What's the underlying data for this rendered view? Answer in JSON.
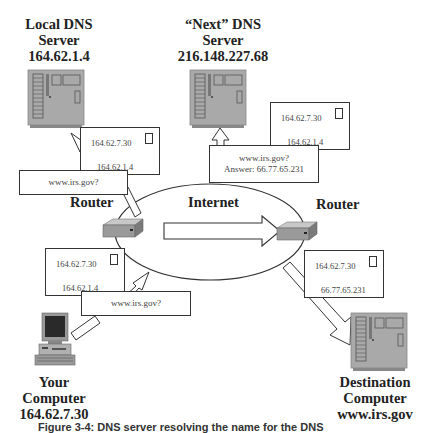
{
  "nodes": {
    "local_dns": {
      "title_lines": [
        "Local DNS",
        "Server",
        "164.62.1.4"
      ],
      "icon": "server-icon"
    },
    "next_dns": {
      "title_lines": [
        "“Next” DNS",
        "Server",
        "216.148.227.68"
      ],
      "icon": "server-icon"
    },
    "your_computer": {
      "title_lines": [
        "Your",
        "Computer",
        "164.62.7.30"
      ],
      "icon": "desktop-computer-icon"
    },
    "destination": {
      "title_lines": [
        "Destination",
        "Computer",
        "www.irs.gov"
      ],
      "icon": "server-icon"
    }
  },
  "routers": {
    "left": {
      "label": "Router",
      "icon": "router-icon"
    },
    "right": {
      "label": "Router",
      "icon": "router-icon"
    }
  },
  "cloud": {
    "label": "Internet"
  },
  "envelopes": {
    "local_dns": {
      "to": "164.62.7.30",
      "from": "164.62.1.4"
    },
    "next_dns": {
      "to": "164.62.7.30",
      "from": "164.62.1.4"
    },
    "your_computer": {
      "to": "164.62.7.30",
      "from": "164.62.1.4"
    },
    "destination": {
      "to": "164.62.7.30",
      "from": "66.77.65.231"
    }
  },
  "queries": {
    "local_dns": {
      "lines": [
        "www.irs.gov?"
      ]
    },
    "next_dns": {
      "lines": [
        "www.irs.gov?",
        "Answer: 66.77.65.231"
      ]
    },
    "your_computer": {
      "lines": [
        "www.irs.gov?"
      ]
    }
  },
  "caption": "Figure 3-4: DNS server resolving the name for the DNS",
  "colors": {
    "server_fill": "#a9a9a9",
    "line": "#333333",
    "background": "#ffffff",
    "text": "#222222"
  }
}
